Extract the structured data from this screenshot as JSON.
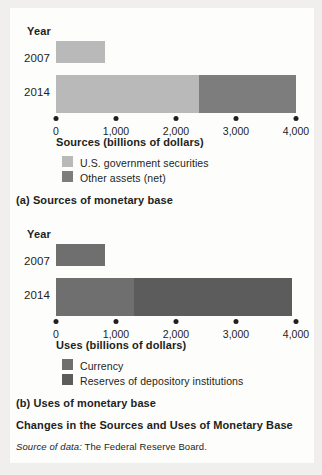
{
  "figure": {
    "title": "Changes in the Sources and Uses of Monetary Base",
    "source_note_prefix": "Source of data:",
    "source_note_body": " The Federal Reserve Board."
  },
  "colors": {
    "ink": "#231f20",
    "paper": "#fdfdfc",
    "margin": "#f0efed",
    "us_gov_securities": "#b9b9b9",
    "other_assets_net": "#7d7d7d",
    "currency": "#6f6f6f",
    "reserves_of_depository_institutions": "#5c5c5c"
  },
  "panel_a": {
    "caption": "(a) Sources of monetary base",
    "year_axis_label": "Year",
    "x_axis_title": "Sources (billions of dollars)",
    "categories": [
      "2007",
      "2014"
    ],
    "tick_labels": [
      "0",
      "1,000",
      "2,000",
      "3,000",
      "4,000"
    ],
    "legend": [
      {
        "label": "U.S. government securities",
        "color_key": "us_gov_securities"
      },
      {
        "label": "Other assets (net)",
        "color_key": "other_assets_net"
      }
    ]
  },
  "panel_b": {
    "caption": "(b) Uses of monetary base",
    "year_axis_label": "Year",
    "x_axis_title": "Uses (billions of dollars)",
    "categories": [
      "2007",
      "2014"
    ],
    "tick_labels": [
      "0",
      "1,000",
      "2,000",
      "3,000",
      "4,000"
    ],
    "legend": [
      {
        "label": "Currency",
        "color_key": "currency"
      },
      {
        "label": "Reserves of depository institutions",
        "color_key": "reserves_of_depository_institutions"
      }
    ]
  },
  "chart_data": [
    {
      "type": "bar",
      "id": "panel_a",
      "orientation": "horizontal",
      "stacked": true,
      "title": "(a) Sources of monetary base",
      "xlabel": "Sources (billions of dollars)",
      "ylabel": "Year",
      "categories": [
        "2007",
        "2014"
      ],
      "xlim": [
        0,
        4000
      ],
      "xticks": [
        0,
        1000,
        2000,
        3000,
        4000
      ],
      "xticklabels": [
        "0",
        "1,000",
        "2,000",
        "3,000",
        "4,000"
      ],
      "grid": false,
      "legend_position": "below-axis-left",
      "series": [
        {
          "name": "U.S. government securities",
          "color": "#b9b9b9",
          "values": [
            820,
            2390
          ]
        },
        {
          "name": "Other assets (net)",
          "color": "#7d7d7d",
          "values": [
            0,
            1610
          ]
        }
      ],
      "totals": [
        820,
        4000
      ]
    },
    {
      "type": "bar",
      "id": "panel_b",
      "orientation": "horizontal",
      "stacked": true,
      "title": "(b) Uses of monetary base",
      "xlabel": "Uses (billions of dollars)",
      "ylabel": "Year",
      "categories": [
        "2007",
        "2014"
      ],
      "xlim": [
        0,
        4000
      ],
      "xticks": [
        0,
        1000,
        2000,
        3000,
        4000
      ],
      "xticklabels": [
        "0",
        "1,000",
        "2,000",
        "3,000",
        "4,000"
      ],
      "grid": false,
      "legend_position": "below-axis-left",
      "series": [
        {
          "name": "Currency",
          "color": "#6f6f6f",
          "values": [
            820,
            1300
          ]
        },
        {
          "name": "Reserves of depository institutions",
          "color": "#5c5c5c",
          "values": [
            0,
            2630
          ]
        }
      ],
      "totals": [
        820,
        3930
      ]
    }
  ]
}
